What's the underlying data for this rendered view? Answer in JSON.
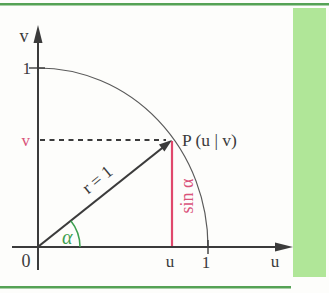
{
  "figure": {
    "labels": {
      "v_axis": "v",
      "u_axis": "u",
      "one_on_v": "1",
      "one_on_u": "1",
      "origin": "0",
      "v_coordinate": "v",
      "u_coordinate": "u",
      "point": "P (u | v)",
      "radius": "r = 1",
      "sine": "sin α",
      "angle": "α"
    },
    "colors": {
      "rule_green": "#55a255",
      "stripe_green": "#b0e698",
      "line_red": "#e0486c",
      "text_red": "#d9537a",
      "text_green": "#3da050",
      "line_dark": "#3b3b3b"
    }
  }
}
